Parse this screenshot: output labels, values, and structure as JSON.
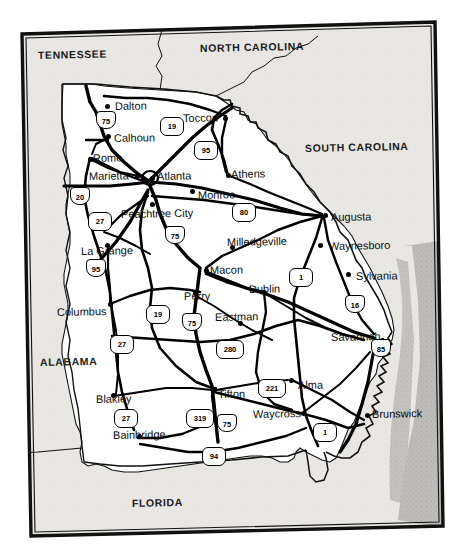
{
  "figure": {
    "kind": "state-highway-map",
    "frame_color": "#000000",
    "land_color": "#ffffff",
    "neighbor_color": "#e8e6e2",
    "ocean_color": "#b9b7b4",
    "road_color": "#000000"
  },
  "states": [
    {
      "name": "TENNESSEE",
      "x": 38,
      "y": 50,
      "rot": -1.2
    },
    {
      "name": "NORTH CAROLINA",
      "x": 200,
      "y": 43,
      "rot": -1.2
    },
    {
      "name": "SOUTH CAROLINA",
      "x": 305,
      "y": 143,
      "rot": -1.2
    },
    {
      "name": "ALABAMA",
      "x": 40,
      "y": 357,
      "rot": -1.2
    },
    {
      "name": "FLORIDA",
      "x": 132,
      "y": 498,
      "rot": -1.2
    }
  ],
  "cities": [
    {
      "name": "Dalton",
      "lx": 115,
      "ly": 101,
      "dx": 107,
      "dy": 106
    },
    {
      "name": "Toccoa",
      "lx": 183,
      "ly": 113,
      "dx": 225,
      "dy": 118
    },
    {
      "name": "Calhoun",
      "lx": 114,
      "ly": 133,
      "dx": 108,
      "dy": 136
    },
    {
      "name": "Rome",
      "lx": 93,
      "ly": 153,
      "dx": 90,
      "dy": 159
    },
    {
      "name": "Marietta",
      "lx": 89,
      "ly": 171,
      "dx": 137,
      "dy": 176
    },
    {
      "name": "Atlanta",
      "lx": 157,
      "ly": 171,
      "dx": 152,
      "dy": 178
    },
    {
      "name": "Athens",
      "lx": 231,
      "ly": 169,
      "dx": 228,
      "dy": 175
    },
    {
      "name": "Monroe",
      "lx": 198,
      "ly": 190,
      "dx": 192,
      "dy": 191
    },
    {
      "name": "Peachtree City",
      "lx": 121,
      "ly": 209,
      "dx": 152,
      "dy": 204
    },
    {
      "name": "Augusta",
      "lx": 331,
      "ly": 212,
      "dx": 325,
      "dy": 215
    },
    {
      "name": "Milledgeville",
      "lx": 227,
      "ly": 237,
      "dx": 232,
      "dy": 247
    },
    {
      "name": "La Grange",
      "lx": 81,
      "ly": 246,
      "dx": 107,
      "dy": 245
    },
    {
      "name": "Waynesboro",
      "lx": 329,
      "ly": 241,
      "dx": 320,
      "dy": 245
    },
    {
      "name": "Macon",
      "lx": 210,
      "ly": 265,
      "dx": 206,
      "dy": 270
    },
    {
      "name": "Dublin",
      "lx": 249,
      "ly": 284,
      "dx": 264,
      "dy": 292
    },
    {
      "name": "Sylvania",
      "lx": 356,
      "ly": 271,
      "dx": 348,
      "dy": 274
    },
    {
      "name": "Perry",
      "lx": 184,
      "ly": 291,
      "dx": 195,
      "dy": 293
    },
    {
      "name": "Columbus",
      "lx": 57,
      "ly": 307,
      "dx": 110,
      "dy": 304
    },
    {
      "name": "Eastman",
      "lx": 215,
      "ly": 312,
      "dx": 240,
      "dy": 323
    },
    {
      "name": "Savannah",
      "lx": 331,
      "ly": 332,
      "dx": 382,
      "dy": 340
    },
    {
      "name": "Blakley",
      "lx": 96,
      "ly": 394,
      "dx": 113,
      "dy": 395
    },
    {
      "name": "Tifton",
      "lx": 218,
      "ly": 389,
      "dx": 214,
      "dy": 389
    },
    {
      "name": "Alma",
      "lx": 298,
      "ly": 380,
      "dx": 291,
      "dy": 380
    },
    {
      "name": "Waycross",
      "lx": 253,
      "ly": 409,
      "dx": 303,
      "dy": 413
    },
    {
      "name": "Brunswick",
      "lx": 372,
      "ly": 409,
      "dx": 367,
      "dy": 415
    },
    {
      "name": "Bainbridge",
      "lx": 113,
      "ly": 430,
      "dx": 139,
      "dy": 436
    }
  ],
  "route_shields": [
    {
      "number": "75",
      "type": "interstate",
      "x": 96,
      "y": 111
    },
    {
      "number": "19",
      "type": "us",
      "x": 160,
      "y": 117
    },
    {
      "number": "95",
      "type": "us",
      "x": 194,
      "y": 141
    },
    {
      "number": "20",
      "type": "interstate",
      "x": 70,
      "y": 187
    },
    {
      "number": "80",
      "type": "us",
      "x": 232,
      "y": 203
    },
    {
      "number": "27",
      "type": "us",
      "x": 88,
      "y": 212
    },
    {
      "number": "75",
      "type": "interstate",
      "x": 165,
      "y": 226
    },
    {
      "number": "95",
      "type": "interstate",
      "x": 86,
      "y": 259
    },
    {
      "number": "1",
      "type": "us",
      "x": 289,
      "y": 268
    },
    {
      "number": "16",
      "type": "interstate",
      "x": 345,
      "y": 295
    },
    {
      "number": "19",
      "type": "us",
      "x": 146,
      "y": 305
    },
    {
      "number": "75",
      "type": "interstate",
      "x": 182,
      "y": 313
    },
    {
      "number": "27",
      "type": "us",
      "x": 110,
      "y": 335
    },
    {
      "number": "280",
      "type": "us",
      "x": 216,
      "y": 340,
      "wide": true
    },
    {
      "number": "85",
      "type": "interstate",
      "x": 371,
      "y": 339
    },
    {
      "number": "221",
      "type": "us",
      "x": 258,
      "y": 379,
      "wide": true
    },
    {
      "number": "319",
      "type": "us",
      "x": 186,
      "y": 409,
      "wide": true
    },
    {
      "number": "75",
      "type": "interstate",
      "x": 217,
      "y": 414
    },
    {
      "number": "27",
      "type": "us",
      "x": 114,
      "y": 409
    },
    {
      "number": "1",
      "type": "us",
      "x": 313,
      "y": 423
    },
    {
      "number": "94",
      "type": "us",
      "x": 202,
      "y": 447
    }
  ]
}
